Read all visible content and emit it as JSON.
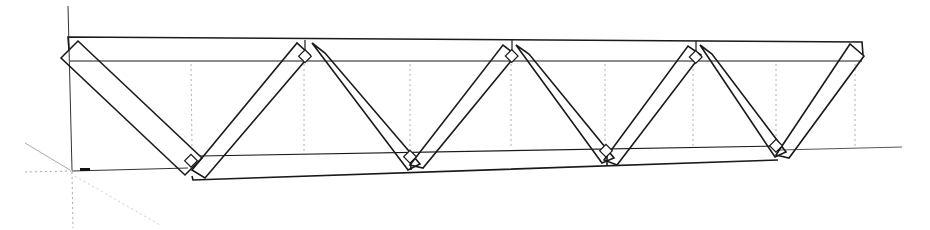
{
  "diagram": {
    "type": "warren-truss-3d-model",
    "colors": {
      "line": "#1a1a1a",
      "faint_line": "#9a9a9a",
      "dotted_guide": "#b0b0b0",
      "background": "#ffffff"
    },
    "panels": 4,
    "top_chord": {
      "x1": 68,
      "y1": 38,
      "x2": 862,
      "y2": 42
    },
    "bottom_chord": {
      "x1": 188,
      "y1": 158,
      "x2": 780,
      "y2": 160
    }
  }
}
